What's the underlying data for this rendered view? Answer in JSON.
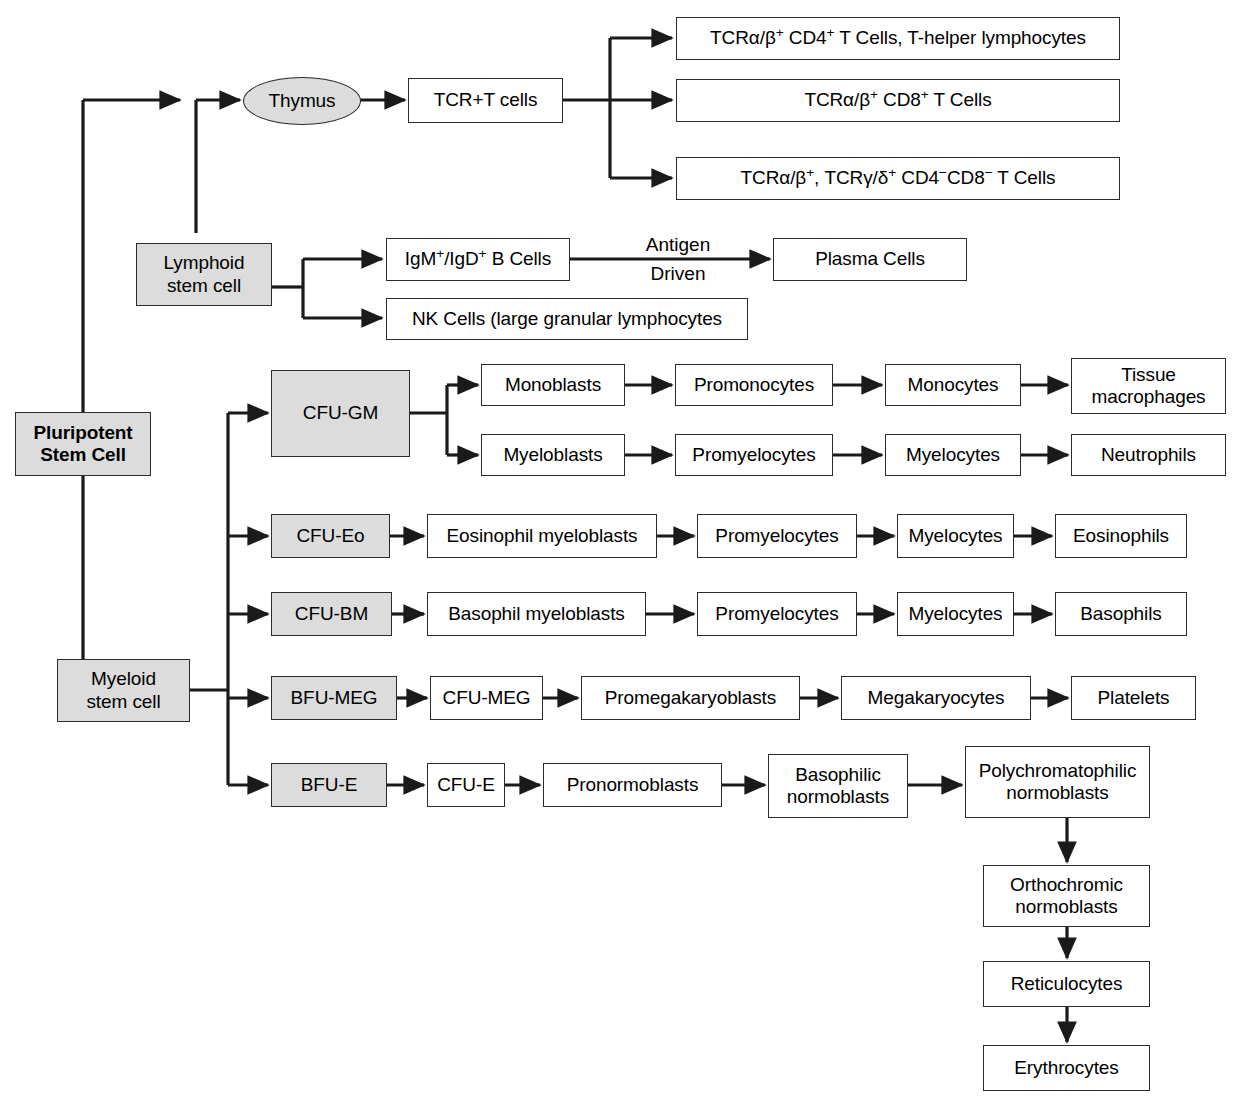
{
  "diagram": {
    "colors": {
      "shaded_fill": "#dcdcdc",
      "plain_fill": "#ffffff",
      "stroke": "#2b2b2b",
      "text": "#000000",
      "background": "#ffffff"
    },
    "nodes": {
      "pluripotent": "Pluripotent\nStem Cell",
      "pluripotent_line1": "Pluripotent",
      "pluripotent_line2": "Stem Cell",
      "lymphoid_line1": "Lymphoid",
      "lymphoid_line2": "stem cell",
      "myeloid_line1": "Myeloid",
      "myeloid_line2": "stem cell",
      "thymus": "Thymus",
      "tcr_t_cells": "TCR+T cells",
      "t_cd4": "TCRα/β+ CD4+ T Cells, T-helper lymphocytes",
      "t_cd8": "TCRα/β+ CD8+ T Cells",
      "t_dn": "TCRα/β+, TCRγ/δ+ CD4−CD8− T Cells",
      "b_cells": "IgM+/IgD+ B Cells",
      "plasma_cells": "Plasma Cells",
      "nk_cells": "NK Cells (large granular lymphocytes",
      "cfu_gm": "CFU-GM",
      "monoblasts": "Monoblasts",
      "promonocytes": "Promonocytes",
      "monocytes": "Monocytes",
      "tissue_macrophages_line1": "Tissue",
      "tissue_macrophages_line2": "macrophages",
      "myeloblasts": "Myeloblasts",
      "promyelocytes_gm": "Promyelocytes",
      "myelocytes_gm": "Myelocytes",
      "neutrophils": "Neutrophils",
      "cfu_eo": "CFU-Eo",
      "eos_myeloblasts": "Eosinophil myeloblasts",
      "promyelocytes_eo": "Promyelocytes",
      "myelocytes_eo": "Myelocytes",
      "eosinophils": "Eosinophils",
      "cfu_bm": "CFU-BM",
      "baso_myeloblasts": "Basophil myeloblasts",
      "promyelocytes_bm": "Promyelocytes",
      "myelocytes_bm": "Myelocytes",
      "basophils": "Basophils",
      "bfu_meg": "BFU-MEG",
      "cfu_meg": "CFU-MEG",
      "promegakaryoblasts": "Promegakaryoblasts",
      "megakaryocytes": "Megakaryocytes",
      "platelets": "Platelets",
      "bfu_e": "BFU-E",
      "cfu_e": "CFU-E",
      "pronormoblasts": "Pronormoblasts",
      "basophilic_line1": "Basophilic",
      "basophilic_line2": "normoblasts",
      "polychromatophilic_line1": "Polychromatophilic",
      "polychromatophilic_line2": "normoblasts",
      "orthochromic_line1": "Orthochromic",
      "orthochromic_line2": "normoblasts",
      "reticulocytes": "Reticulocytes",
      "erythrocytes": "Erythrocytes"
    },
    "edge_labels": {
      "antigen": "Antigen",
      "driven": "Driven"
    }
  }
}
